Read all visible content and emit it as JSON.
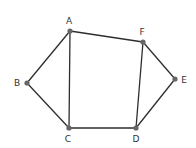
{
  "diagram": {
    "type": "graph",
    "colors": {
      "edge": "#2e2e2e",
      "vertex": "#666666",
      "label": "#333333",
      "background": "#ffffff"
    },
    "vertices": [
      {
        "id": "A",
        "label": "A",
        "x": 70,
        "y": 31,
        "label_x": 69,
        "label_y": 21
      },
      {
        "id": "B",
        "label": "B",
        "x": 27,
        "y": 83,
        "label_x": 17,
        "label_y": 83
      },
      {
        "id": "C",
        "label": "C",
        "x": 69,
        "y": 128,
        "label_x": 68,
        "label_y": 139
      },
      {
        "id": "D",
        "label": "D",
        "x": 136,
        "y": 128,
        "label_x": 136,
        "label_y": 139
      },
      {
        "id": "E",
        "label": "E",
        "x": 175,
        "y": 79,
        "label_x": 184,
        "label_y": 80
      },
      {
        "id": "F",
        "label": "F",
        "x": 143,
        "y": 42,
        "label_x": 142,
        "label_y": 32
      }
    ],
    "edges": [
      [
        "A",
        "B"
      ],
      [
        "B",
        "C"
      ],
      [
        "A",
        "C"
      ],
      [
        "A",
        "F"
      ],
      [
        "F",
        "D"
      ],
      [
        "C",
        "D"
      ],
      [
        "F",
        "E"
      ],
      [
        "E",
        "D"
      ]
    ]
  }
}
